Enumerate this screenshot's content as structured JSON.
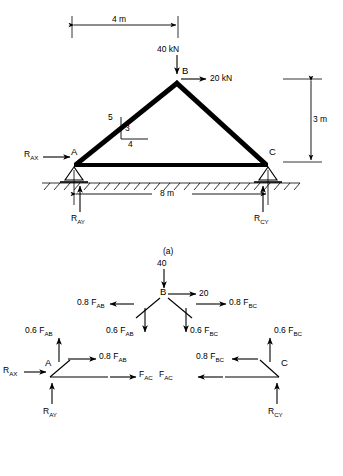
{
  "figure": {
    "parts": [
      {
        "key": "a",
        "caption": "(a)"
      }
    ]
  },
  "part_a": {
    "caption": "(a)",
    "dim_top": "4 m",
    "dim_bottom": "8 m",
    "dim_right": "3 m",
    "load_vertical": "40 kN",
    "load_horizontal": "20 kN",
    "joint_a": "A",
    "joint_b": "B",
    "joint_c": "C",
    "reaction_ax": "R",
    "reaction_ax_sub": "AX",
    "reaction_ay": "R",
    "reaction_ay_sub": "AY",
    "reaction_cy": "R",
    "reaction_cy_sub": "CY",
    "slope_hyp": "5",
    "slope_vert": "3",
    "slope_horiz": "4"
  },
  "part_b": {
    "joint_b": {
      "label": "B",
      "load_vertical": "40",
      "load_horizontal": "20",
      "force_left_x": "0.8 F",
      "force_left_x_sub": "AB",
      "force_right_x": "0.8 F",
      "force_right_x_sub": "BC",
      "force_left_y": "0.6 F",
      "force_left_y_sub": "AB",
      "force_right_y": "0.6 F",
      "force_right_y_sub": "BC"
    },
    "joint_a": {
      "label": "A",
      "reaction_x": "R",
      "reaction_x_sub": "AX",
      "reaction_y": "R",
      "reaction_y_sub": "AY",
      "force_y": "0.6 F",
      "force_y_sub": "AB",
      "force_x": "0.8 F",
      "force_x_sub": "AB",
      "force_ac": "F",
      "force_ac_sub": "AC"
    },
    "joint_c": {
      "label": "C",
      "reaction_y": "R",
      "reaction_y_sub": "CY",
      "force_y": "0.6 F",
      "force_y_sub": "BC",
      "force_x": "0.8 F",
      "force_x_sub": "BC",
      "force_ac": "F",
      "force_ac_sub": "AC"
    }
  },
  "colors": {
    "line": "#000000",
    "background": "#ffffff"
  }
}
